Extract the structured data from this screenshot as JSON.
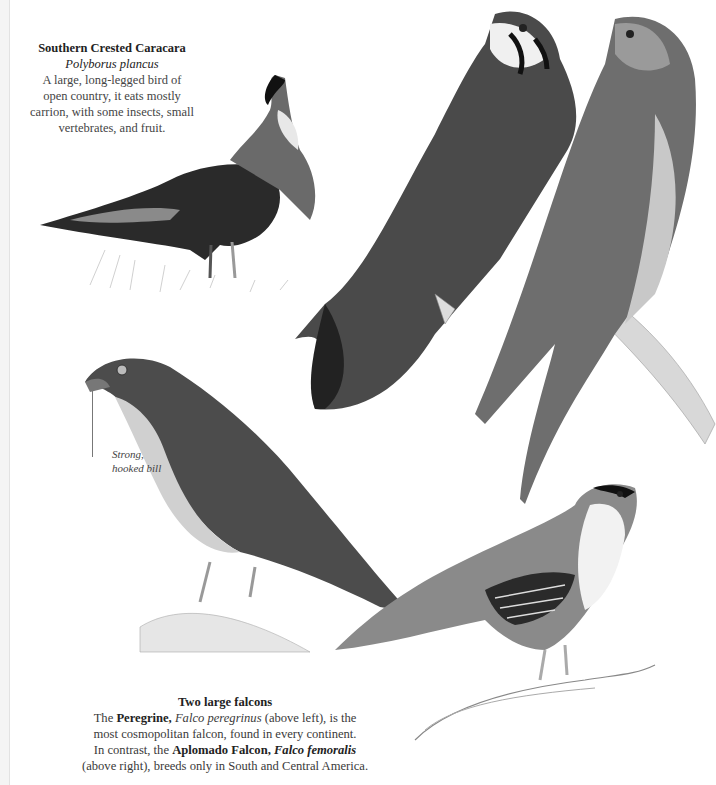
{
  "page": {
    "background": "#ffffff",
    "caracara": {
      "title": "Southern Crested Caracara",
      "scientific_name": "Polyborus plancus",
      "description": [
        "A large, long-legged bird of",
        "open country, it eats mostly",
        "carrion, with some insects, small",
        "vertebrates, and fruit."
      ]
    },
    "annotation": {
      "line1": "Strong,",
      "line2": "hooked bill"
    },
    "falcons": {
      "title": "Two large falcons",
      "l1_a": "The ",
      "l1_b": "Peregrine, ",
      "l1_c": "Falco peregrinus",
      "l1_d": " (above left), is the",
      "l2": "most cosmopolitan falcon, found in every continent.",
      "l3_a": "In contrast, the ",
      "l3_b": "Aplomado Falcon, ",
      "l3_c": "Falco femoralis",
      "l4": "(above right), breeds only in South and Central America."
    },
    "illustrations": [
      "southern-crested-caracara",
      "american-kestrel-pair",
      "peregrine-falcon",
      "aplomado-falcon"
    ]
  }
}
